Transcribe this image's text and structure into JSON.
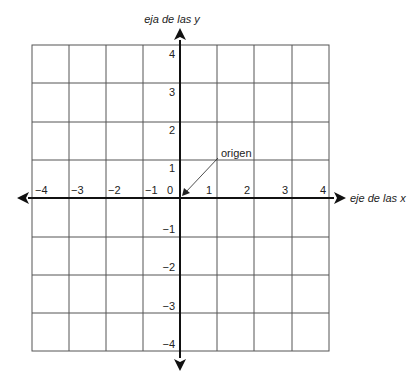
{
  "axes": {
    "x_label": "eje de las x",
    "y_label": "eja de las y"
  },
  "annotation": {
    "text": "origen"
  },
  "x_ticks": [
    "−4",
    "−3",
    "−2",
    "−1",
    "0",
    "1",
    "2",
    "3",
    "4"
  ],
  "y_ticks": [
    "4",
    "3",
    "2",
    "1",
    "−1",
    "−2",
    "−3",
    "−4"
  ],
  "grid": {
    "cells_x": 8,
    "cells_y": 8,
    "range": [
      -4,
      4
    ]
  },
  "colors": {
    "grid": "#555555",
    "axis": "#111111",
    "text": "#222222"
  }
}
